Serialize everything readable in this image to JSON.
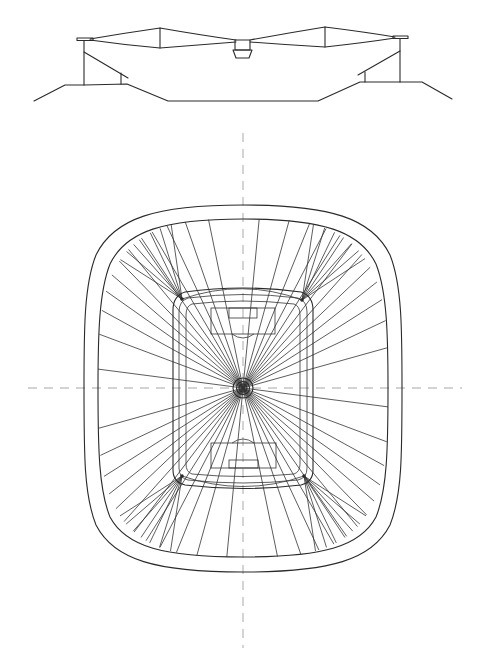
{
  "figure": {
    "title": "Stadium section and roof plan",
    "background": "#ffffff",
    "line_color": "#2a2a2a",
    "axis_color": "#a8a8a8"
  },
  "section": {
    "label": "Cross-section elevation",
    "roof_left_plate": [
      77,
      39,
      92,
      39
    ],
    "roof_right_plate": [
      393,
      37,
      408,
      37
    ],
    "roof_peaks": [
      {
        "x": 160,
        "top": 28,
        "bottom": 48
      },
      {
        "x": 325,
        "top": 27,
        "bottom": 47
      }
    ],
    "hub": {
      "x": 235,
      "y": 40,
      "w": 15,
      "h": 10
    },
    "scoreboard": {
      "top": 50,
      "bottom": 58,
      "top_x": [
        233,
        252
      ],
      "bottom_x": [
        236,
        249
      ]
    }
  },
  "plan": {
    "label": "Roof plan view",
    "center": {
      "x": 243,
      "y": 388
    },
    "outer_oval": {
      "left": 84,
      "right": 402,
      "top": 205,
      "bottom": 572
    },
    "inner_oval": {
      "left": 98,
      "right": 388,
      "top": 219,
      "bottom": 557
    },
    "bowl": {
      "left": 173,
      "right": 313,
      "top": 291,
      "bottom": 488
    },
    "corner_nodes": [
      [
        182,
        299
      ],
      [
        302,
        300
      ],
      [
        182,
        476
      ],
      [
        304,
        476
      ]
    ],
    "hub_rings": [
      10,
      6,
      4
    ],
    "radial_count": 48,
    "pitch": {
      "top_penalty_box": [
        211,
        308,
        275,
        334
      ],
      "top_goal_box": [
        229,
        308,
        257,
        318
      ],
      "bottom_penalty_box": [
        211,
        443,
        276,
        468
      ],
      "bottom_goal_box": [
        229,
        460,
        258,
        468
      ]
    },
    "axes": {
      "horizontal": [
        28,
        462
      ],
      "vertical": [
        133,
        648
      ]
    }
  }
}
